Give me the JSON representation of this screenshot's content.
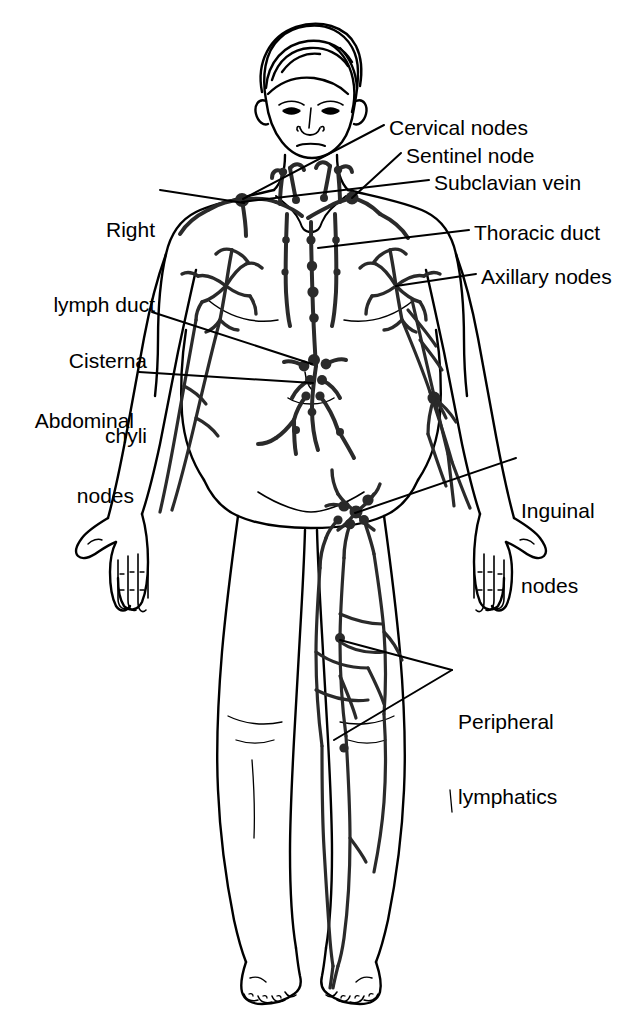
{
  "figure": {
    "background_color": "#ffffff",
    "line_color": "#000000",
    "text_color": "#000000"
  },
  "labels": [
    {
      "id": "cervical-nodes",
      "text": "Cervical nodes",
      "align": "left",
      "x": 389,
      "y": 115,
      "leader": "from text left edge down-left to cervical chain on neck"
    },
    {
      "id": "sentinel-node",
      "text": "Sentinel node",
      "align": "left",
      "x": 406,
      "y": 143,
      "leader": "from text left edge down-left to node at base of neck"
    },
    {
      "id": "subclavian-vein",
      "text": "Subclavian vein",
      "align": "left",
      "x": 434,
      "y": 170,
      "leader": "from text left edge down-left to subclavian region"
    },
    {
      "id": "right-lymph-duct",
      "text": "Right\nlymph duct",
      "line1": "Right",
      "line2": "lymph duct",
      "align": "right",
      "x": 47,
      "y": 167,
      "leader": "from text right edge right and slightly down to right lymph duct node"
    },
    {
      "id": "thoracic-duct",
      "text": "Thoracic duct",
      "align": "left",
      "x": 474,
      "y": 220,
      "leader": "from text left edge left to central thoracic duct chain"
    },
    {
      "id": "axillary-nodes",
      "text": "Axillary nodes",
      "align": "left",
      "x": 481,
      "y": 264,
      "leader": "from text left edge left to axillary node cluster"
    },
    {
      "id": "cisterna-chyli",
      "text": "Cisterna\nchyli",
      "line1": "Cisterna",
      "line2": "chyli",
      "align": "right",
      "x": 66,
      "y": 298,
      "leader": "from text right edge right and down to cisterna chyli"
    },
    {
      "id": "abdominal-nodes",
      "text": "Abdominal\nnodes",
      "line1": "Abdominal",
      "line2": "nodes",
      "align": "right",
      "x": 35,
      "y": 358,
      "leader": "from text right edge right to abdominal node chain"
    },
    {
      "id": "inguinal-nodes",
      "text": "Inguinal\nnodes",
      "line1": "Inguinal",
      "line2": "nodes",
      "align": "left",
      "x": 521,
      "y": 448,
      "leader": "from text left edge down-left to inguinal node cluster"
    },
    {
      "id": "peripheral-lymphatics",
      "text": "Peripheral\nlymphatics",
      "line1": "Peripheral",
      "line2": "lymphatics",
      "align": "left",
      "x": 458,
      "y": 659,
      "leader": "two-branch V leader from text left edge to thigh and knee lymphatic vessels"
    }
  ],
  "anatomy": {
    "structures": [
      "head with side-parted hair",
      "face with eyes, nose, mouth, ears",
      "neck with cervical lymphatic chains",
      "torso with clavicles and nipples",
      "both arms extended downward with open hands",
      "both legs with knees and feet with toes",
      "central thoracic duct chain",
      "left and right axillary node plexus",
      "abdominal para-aortic node chain",
      "cisterna chyli",
      "inguinal node cluster",
      "peripheral lymphatic vessels on leg"
    ]
  }
}
